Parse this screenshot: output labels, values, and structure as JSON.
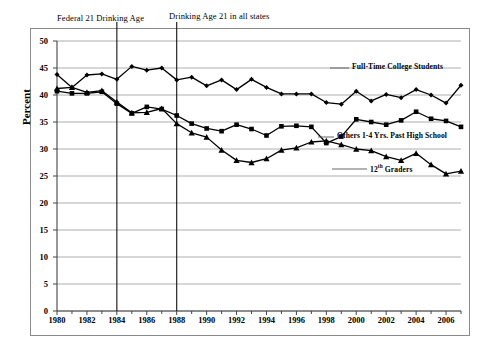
{
  "chart_data": {
    "type": "line",
    "title": "",
    "subtitle": "",
    "xlabel": "",
    "ylabel": "Percent",
    "ylim": [
      0,
      50
    ],
    "xlim": [
      1980,
      2007
    ],
    "ytick_step": 5,
    "yticks": [
      "0",
      "5",
      "10",
      "15",
      "20",
      "25",
      "30",
      "35",
      "40",
      "45",
      "50"
    ],
    "xticks": [
      "1980",
      "1982",
      "1984",
      "1986",
      "1988",
      "1990",
      "1992",
      "1994",
      "1996",
      "1998",
      "2000",
      "2002",
      "2004",
      "2006"
    ],
    "grid": "horizontal",
    "legend_position": "inline-right",
    "x": [
      1980,
      1981,
      1982,
      1983,
      1984,
      1985,
      1986,
      1987,
      1988,
      1989,
      1990,
      1991,
      1992,
      1993,
      1994,
      1995,
      1996,
      1997,
      1998,
      1999,
      2000,
      2001,
      2002,
      2003,
      2004,
      2005,
      2006,
      2007
    ],
    "series": [
      {
        "name": "Full-Time College Students",
        "marker": "diamond",
        "color": "#000000",
        "values": [
          43.8,
          41.4,
          43.7,
          43.9,
          42.9,
          45.3,
          44.6,
          45.0,
          42.8,
          43.3,
          41.7,
          42.8,
          41.0,
          42.9,
          41.4,
          40.2,
          40.2,
          40.2,
          38.6,
          38.3,
          40.7,
          38.9,
          40.1,
          39.5,
          41.0,
          40.0,
          38.5,
          41.8
        ],
        "values_tail": [
          40.2,
          40.2,
          41.2
        ]
      },
      {
        "name": "Others 1-4 Yrs. Past High School",
        "marker": "square",
        "color": "#000000",
        "values": [
          40.7,
          40.3,
          40.3,
          40.6,
          38.4,
          36.6,
          37.8,
          37.4,
          36.2,
          34.7,
          33.8,
          33.3,
          34.5,
          33.7,
          32.5,
          34.2,
          34.3,
          34.1,
          31.1,
          32.3,
          35.5,
          35.0,
          34.5,
          35.3,
          36.9,
          35.6,
          35.2,
          34.1
        ]
      },
      {
        "name": "12th Graders",
        "marker": "triangle",
        "color": "#000000",
        "values": [
          41.2,
          41.4,
          40.5,
          40.8,
          38.7,
          36.7,
          36.8,
          37.5,
          34.7,
          33.0,
          32.2,
          29.8,
          27.9,
          27.5,
          28.2,
          29.8,
          30.2,
          31.3,
          31.5,
          30.8,
          30.0,
          29.7,
          28.6,
          27.9,
          29.2,
          27.1,
          25.4,
          25.9
        ]
      }
    ],
    "annotations": [
      {
        "label": "Federal 21 Drinking Age",
        "x": 1984
      },
      {
        "label": "Drinking Age 21 in all states",
        "x": 1988
      }
    ]
  }
}
